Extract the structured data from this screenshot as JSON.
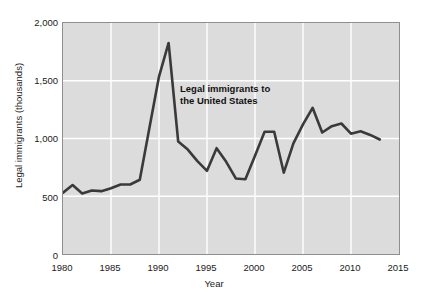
{
  "chart_data": {
    "type": "line",
    "title": "",
    "xlabel": "Year",
    "ylabel": "Legal immigrants (thousands)",
    "xlim": [
      1980,
      2015
    ],
    "ylim": [
      0,
      2000
    ],
    "xticks": [
      "1980",
      "1985",
      "1990",
      "1995",
      "2000",
      "2005",
      "2010",
      "2015"
    ],
    "yticks": [
      "0",
      "500",
      "1,000",
      "1,500",
      "2,000"
    ],
    "grid": true,
    "legend_position": "none",
    "annotations": [
      {
        "text_line1": "Legal immigrants to",
        "text_line2": "the United States",
        "x": 1995,
        "y": 1400
      }
    ],
    "series": [
      {
        "name": "Legal immigrants to the United States",
        "color": "#3a3a3a",
        "x": [
          1980,
          1981,
          1982,
          1983,
          1984,
          1985,
          1986,
          1987,
          1988,
          1989,
          1990,
          1991,
          1992,
          1993,
          1994,
          1995,
          1996,
          1997,
          1998,
          1999,
          2000,
          2001,
          2002,
          2003,
          2004,
          2005,
          2006,
          2007,
          2008,
          2009,
          2010,
          2011,
          2012,
          2013
        ],
        "values": [
          531,
          597,
          524,
          550,
          544,
          570,
          602,
          602,
          643,
          1091,
          1536,
          1827,
          974,
          904,
          804,
          720,
          916,
          798,
          654,
          647,
          850,
          1059,
          1059,
          704,
          958,
          1122,
          1266,
          1052,
          1107,
          1130,
          1042,
          1062,
          1031,
          991
        ]
      }
    ]
  },
  "colors": {
    "plot_background": "#dcdcdc",
    "gridline": "#ffffff",
    "line": "#3a3a3a",
    "axis_border": "#8f8f8f",
    "text": "#1a1a1a"
  }
}
